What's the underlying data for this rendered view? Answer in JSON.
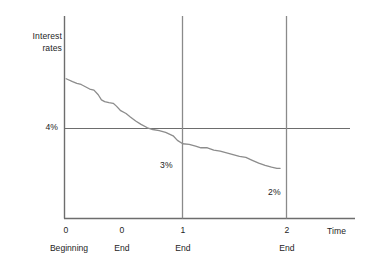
{
  "chart_data": {
    "type": "line",
    "title": "",
    "subtitle": "",
    "ylabel_lines": [
      "Interest",
      "rates"
    ],
    "ylabel": "Interest rates",
    "xlabel": "Time",
    "grid": true,
    "legend": null,
    "xlim": [
      -0.02,
      2.7
    ],
    "ylim": [
      1.55,
      5.1
    ],
    "x_ticks": [
      {
        "value": 0.0,
        "label": "0",
        "sublabel": "Beginning",
        "gridline": false
      },
      {
        "value": 0.5,
        "label": "0",
        "sublabel": "End",
        "gridline": false
      },
      {
        "value": 1.0,
        "label": "1",
        "sublabel": "End",
        "gridline": true
      },
      {
        "value": 2.0,
        "label": "2",
        "sublabel": "End",
        "gridline": true
      }
    ],
    "y_ticks": [
      {
        "value": 4.0,
        "label": "4%",
        "reference_line": true
      }
    ],
    "annotations": [
      {
        "text": "4%",
        "x": -0.15,
        "y": 4.0
      },
      {
        "text": "3%",
        "x": 0.87,
        "y": 3.38
      },
      {
        "text": "2%",
        "x": 1.81,
        "y": 2.62
      }
    ],
    "series": [
      {
        "name": "Interest rate path",
        "color": "#8c8c8c",
        "points": [
          [
            0.0,
            4.0
          ],
          [
            0.06,
            3.95
          ],
          [
            0.1,
            3.92
          ],
          [
            0.14,
            3.9
          ],
          [
            0.18,
            3.86
          ],
          [
            0.22,
            3.82
          ],
          [
            0.26,
            3.8
          ],
          [
            0.3,
            3.72
          ],
          [
            0.33,
            3.63
          ],
          [
            0.36,
            3.6
          ],
          [
            0.4,
            3.58
          ],
          [
            0.44,
            3.57
          ],
          [
            0.47,
            3.52
          ],
          [
            0.51,
            3.44
          ],
          [
            0.56,
            3.39
          ],
          [
            0.6,
            3.33
          ],
          [
            0.65,
            3.26
          ],
          [
            0.7,
            3.2
          ],
          [
            0.76,
            3.14
          ],
          [
            0.81,
            3.11
          ],
          [
            0.87,
            3.09
          ],
          [
            0.93,
            3.06
          ],
          [
            1.0,
            3.0
          ],
          [
            1.04,
            2.92
          ],
          [
            1.09,
            2.86
          ],
          [
            1.15,
            2.85
          ],
          [
            1.21,
            2.82
          ],
          [
            1.26,
            2.79
          ],
          [
            1.32,
            2.79
          ],
          [
            1.38,
            2.75
          ],
          [
            1.44,
            2.73
          ],
          [
            1.5,
            2.7
          ],
          [
            1.56,
            2.67
          ],
          [
            1.62,
            2.64
          ],
          [
            1.68,
            2.62
          ],
          [
            1.74,
            2.57
          ],
          [
            1.8,
            2.52
          ],
          [
            1.86,
            2.48
          ],
          [
            1.92,
            2.45
          ],
          [
            1.97,
            2.43
          ],
          [
            2.0,
            2.43
          ]
        ]
      }
    ],
    "reference_lines": [
      {
        "orientation": "horizontal",
        "value": 4.0,
        "color": "#6d6d6d"
      },
      {
        "orientation": "vertical",
        "value": 1.0,
        "color": "#8a8a8a"
      },
      {
        "orientation": "vertical",
        "value": 2.0,
        "color": "#8a8a8a"
      }
    ],
    "colors": {
      "axis": "#6d6d6d",
      "curve": "#8c8c8c",
      "gridline": "#8a8a8a",
      "text": "#242424",
      "background": "#ffffff"
    }
  }
}
